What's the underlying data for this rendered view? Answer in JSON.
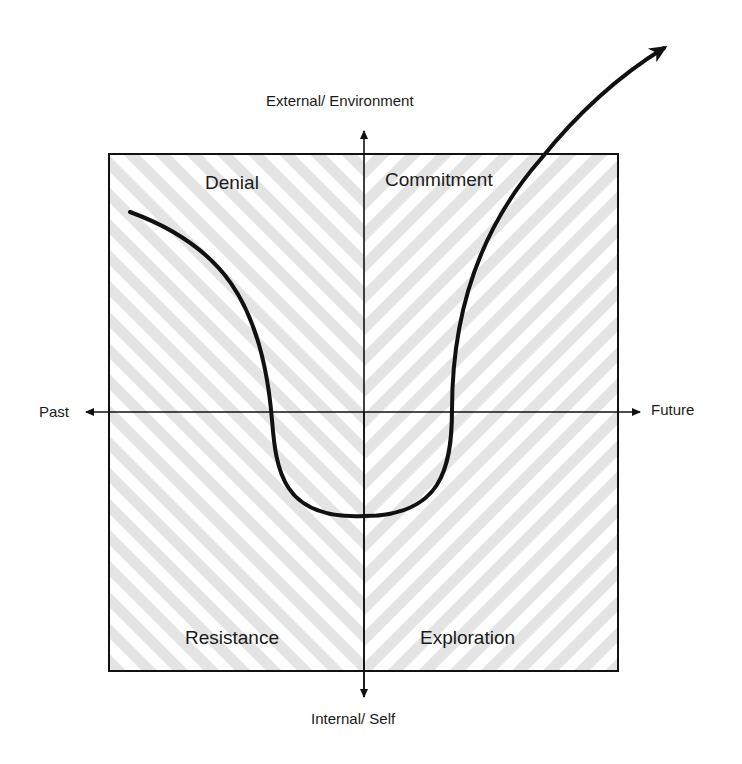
{
  "axes": {
    "top": "External/ Environment",
    "bottom": "Internal/ Self",
    "left": "Past",
    "right": "Future"
  },
  "quadrants": {
    "top_left": "Denial",
    "top_right": "Commitment",
    "bottom_left": "Resistance",
    "bottom_right": "Exploration"
  },
  "colors": {
    "line": "#111111",
    "stripe": "#e2e2e2",
    "background": "#ffffff"
  }
}
